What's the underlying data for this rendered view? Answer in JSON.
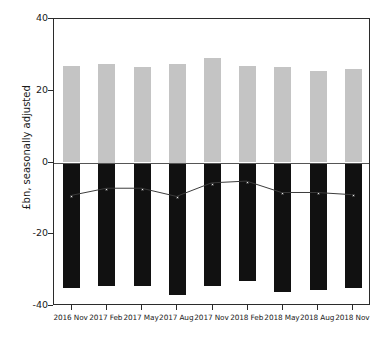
{
  "chart_data": {
    "type": "bar",
    "title": "",
    "subtitle": "",
    "xlabel": "",
    "ylabel": "£bn, seasonally adjusted",
    "ylim": [
      -40,
      40
    ],
    "yticks": [
      40,
      20,
      0,
      -20,
      -40
    ],
    "ytick_labels": [
      "40",
      "20",
      "0",
      "-20",
      "-40"
    ],
    "grid": false,
    "legend_position": "none",
    "categories": [
      "2016 Nov",
      "2017 Feb",
      "2017 May",
      "2017 Aug",
      "2017 Nov",
      "2018 Feb",
      "2018 May",
      "2018 Aug",
      "2018 Nov"
    ],
    "series": [
      {
        "name": "Credits",
        "type": "bar",
        "color": "#c4c4c4",
        "values": [
          27.0,
          27.5,
          26.5,
          27.5,
          29.0,
          27.0,
          26.5,
          25.5,
          26.0
        ]
      },
      {
        "name": "Debits",
        "type": "bar",
        "color": "#111111",
        "values": [
          -35.0,
          -34.5,
          -34.5,
          -37.0,
          -34.5,
          -33.0,
          -36.0,
          -35.5,
          -35.0
        ]
      },
      {
        "name": "Balance",
        "type": "line",
        "color": "#3a3a3a",
        "values": [
          -9.5,
          -7.5,
          -7.5,
          -9.8,
          -6.0,
          -5.5,
          -8.7,
          -8.7,
          -9.3
        ]
      }
    ]
  },
  "axis": {
    "y_title": "£bn, seasonally adjusted"
  }
}
